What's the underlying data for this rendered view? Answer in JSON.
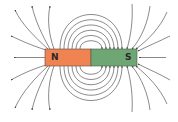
{
  "diagram": {
    "title": "",
    "magnet": {
      "north": {
        "label": "N",
        "color": "#ef8452"
      },
      "south": {
        "label": "S",
        "color": "#6ea774"
      }
    },
    "field_line_color": "#3a3a3a",
    "inner_loops_per_side": 6,
    "outer_lines_from_north": 7,
    "outer_lines_into_south": 7
  }
}
